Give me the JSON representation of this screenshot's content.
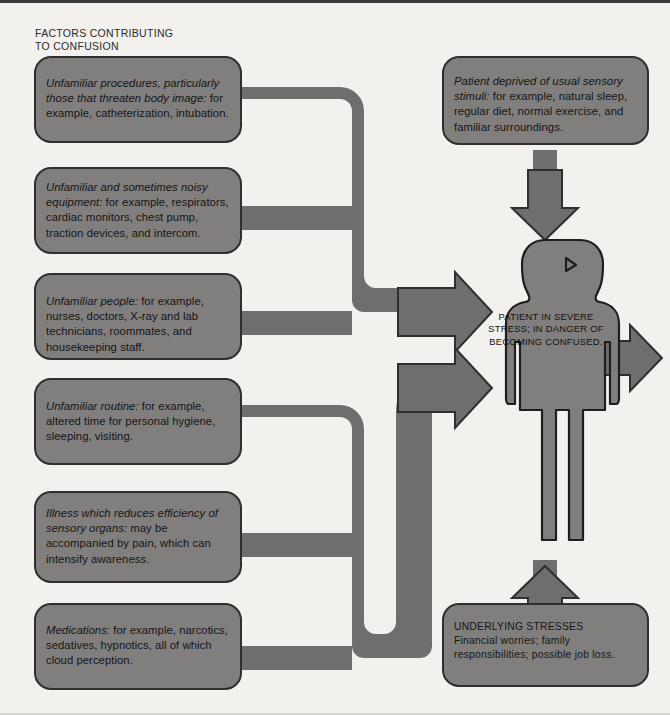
{
  "heading": "FACTORS CONTRIBUTING\nTO CONFUSION",
  "colors": {
    "background": "#f2f1ee",
    "box_fill": "#807f7d",
    "box_outline": "#2f2f2f",
    "pipe_fill": "#6f6e6c",
    "text": "#151515"
  },
  "left_factors": [
    {
      "id": "unfamiliar-procedures",
      "lead": "Unfamiliar procedures, particularly those that threaten body image:",
      "rest": " for example, catheterization, intubation."
    },
    {
      "id": "unfamiliar-equipment",
      "lead": "Unfamiliar and sometimes noisy equipment:",
      "rest": " for example, respirators, cardiac monitors, chest pump, traction devices, and intercom."
    },
    {
      "id": "unfamiliar-people",
      "lead": "Unfamiliar people:",
      "rest": " for example, nurses, doctors, X-ray and lab technicians, roommates, and housekeeping staff."
    },
    {
      "id": "unfamiliar-routine",
      "lead": "Unfamiliar routine:",
      "rest": " for example, altered time for personal hygiene, sleeping, visiting."
    },
    {
      "id": "illness-sensory-organs",
      "lead": "Illness which reduces efficiency of sensory organs:",
      "rest": " may be accompanied by pain, which can intensify awareness."
    },
    {
      "id": "medications",
      "lead": "Medications:",
      "rest": " for example, narcotics, sedatives, hypnotics, all of which cloud perception."
    }
  ],
  "top_right_box": {
    "id": "sensory-deprivation",
    "lead": "Patient deprived of usual sensory stimuli:",
    "rest": " for example, natural sleep, regular diet, normal exercise, and familiar surroundings."
  },
  "bottom_right_box": {
    "id": "underlying-stresses",
    "title": "UNDERLYING STRESSES",
    "body": "Financial worries; family responsibilities; possible job loss."
  },
  "patient_figure": {
    "label": "PATIENT IN SEVERE STRESS; IN DANGER OF BECOMING CONFUSED."
  },
  "arrows": {
    "top_down": "arrow-down-into-patient",
    "bottom_up": "arrow-up-into-patient",
    "left_upper": "arrow-right-upper-into-patient",
    "left_lower": "arrow-right-lower-into-patient",
    "outgoing": "arrow-right-outgoing"
  }
}
